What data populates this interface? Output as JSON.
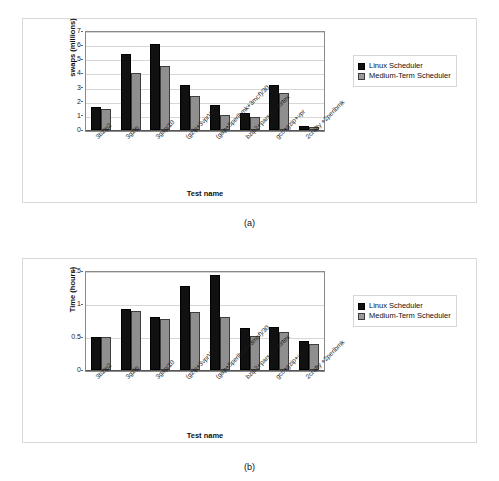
{
  "legend": {
    "items": [
      {
        "label": "Linux Scheduler",
        "color": "#111111",
        "key": "linux"
      },
      {
        "label": "Medium-Term Scheduler",
        "color": "#8f8f8f",
        "key": "medium"
      }
    ]
  },
  "figures": [
    {
      "id": "a",
      "caption": "(a)",
      "chart_data": {
        "type": "bar",
        "title": "",
        "xlabel": "Test name",
        "ylabel": "swaps (millions)",
        "ylim": [
          0,
          7
        ],
        "yticks": [
          0,
          1,
          2,
          3,
          4,
          5,
          6,
          7
        ],
        "ytick_labels": [
          "0",
          "1",
          "2",
          "3",
          "4",
          "5",
          "6",
          "7"
        ],
        "grid": true,
        "legend_position": "right",
        "categories": [
          "3bzip2",
          "3gzip",
          "3gap/10",
          "(gzip+3vpr)/2",
          "(gap+5perlbmk+3mcf)/30",
          "bzip2+parser+vortex",
          "gcc+gzip+vpr",
          "2crafty +2perlbmk"
        ],
        "series": [
          {
            "name": "Linux Scheduler",
            "values": [
              1.65,
              5.4,
              6.1,
              3.15,
              1.75,
              1.2,
              3.2,
              0.25
            ]
          },
          {
            "name": "Medium-Term Scheduler",
            "values": [
              1.5,
              4.0,
              4.5,
              2.4,
              1.05,
              0.95,
              2.6,
              0.18
            ]
          }
        ]
      }
    },
    {
      "id": "b",
      "caption": "(b)",
      "chart_data": {
        "type": "bar",
        "title": "",
        "xlabel": "Test name",
        "ylabel": "Time (hours)",
        "ylim": [
          0,
          1.5
        ],
        "yticks": [
          0,
          0.5,
          1,
          1.5
        ],
        "ytick_labels": [
          "0",
          "0.5",
          "1",
          "1.5"
        ],
        "grid": true,
        "legend_position": "right",
        "categories": [
          "3bzip2",
          "3gzip",
          "3gap/10",
          "(gzip+3vpr)/2",
          "(gap+5perlbmk+3mcf)/30",
          "bzip2+parser+vortex",
          "gcc+gzip+vpr",
          "2crafty +2perlbmk"
        ],
        "series": [
          {
            "name": "Linux Scheduler",
            "values": [
              0.5,
              0.92,
              0.81,
              1.27,
              1.44,
              0.63,
              0.65,
              0.44
            ]
          },
          {
            "name": "Medium-Term Scheduler",
            "values": [
              0.5,
              0.9,
              0.77,
              0.88,
              0.81,
              0.51,
              0.57,
              0.39
            ]
          }
        ]
      }
    }
  ]
}
